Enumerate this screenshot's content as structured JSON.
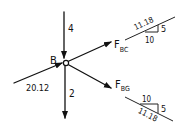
{
  "diagram": {
    "type": "free-body diagram",
    "node": {
      "label": "B"
    },
    "forces": [
      {
        "id": "load_top",
        "label": "4",
        "direction": "down",
        "position": "above node, pointing into node"
      },
      {
        "id": "load_bottom",
        "label": "2",
        "direction": "down",
        "position": "below node, pointing away from node"
      },
      {
        "id": "member_left",
        "label": "20.12",
        "direction": "up-right",
        "position": "lower-left, pointing into node"
      },
      {
        "id": "F_BC",
        "label_main": "F",
        "label_sub": "BC",
        "direction": "up-right",
        "position": "upper-right, pointing away from node"
      },
      {
        "id": "F_BG",
        "label_main": "F",
        "label_sub": "BG",
        "direction": "down-right",
        "position": "lower-right, pointing away from node"
      }
    ],
    "slope_triangles": [
      {
        "id": "bc_slope",
        "hypotenuse": "11.18",
        "vertical": "5",
        "horizontal": "10"
      },
      {
        "id": "bg_slope",
        "horizontal": "10",
        "vertical": "5",
        "hypotenuse": "11.18"
      }
    ],
    "colors": {
      "ink": "#111111",
      "background": "#ffffff"
    }
  }
}
